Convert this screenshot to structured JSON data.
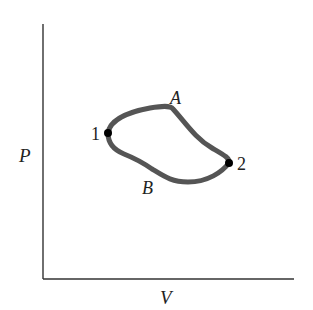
{
  "diagram": {
    "type": "pv-diagram",
    "axes": {
      "x_label": "V",
      "y_label": "P"
    },
    "points": [
      {
        "id": "1",
        "label": "1"
      },
      {
        "id": "2",
        "label": "2"
      }
    ],
    "paths": [
      {
        "id": "A",
        "label": "A",
        "from": "1",
        "to": "2",
        "position": "upper"
      },
      {
        "id": "B",
        "label": "B",
        "from": "2",
        "to": "1",
        "position": "lower"
      }
    ],
    "colors": {
      "axis": "#333333",
      "curve": "#555555",
      "point": "#000000",
      "text": "#222222"
    }
  }
}
